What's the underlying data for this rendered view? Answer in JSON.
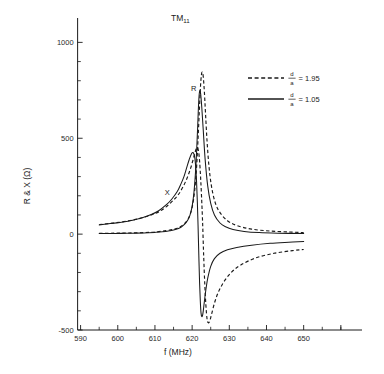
{
  "chart_data": {
    "type": "line",
    "title": "TM11",
    "title_base": "TM",
    "title_sub": "11",
    "xlabel": "f (MHz)",
    "ylabel": "R & X (Ω)",
    "ylabel_base": "R & X (",
    "ylabel_unit": "Ω",
    "ylabel_close": ")",
    "xlim": [
      585,
      663
    ],
    "ylim": [
      -500,
      1075
    ],
    "xticks": [
      590,
      600,
      610,
      620,
      630,
      640,
      650
    ],
    "xtick_labels": [
      "590",
      "600",
      "610",
      "620",
      "630",
      "640",
      "650"
    ],
    "xtick_minor_step": 5,
    "yticks": [
      -500,
      0,
      500,
      1000
    ],
    "ytick_labels": [
      "-500",
      "0",
      "500",
      "1000"
    ],
    "ytick_minor_step": 100,
    "grid": false,
    "legend_position": "upper right",
    "annotations": [
      {
        "text": "R",
        "x": 620.4,
        "y": 745,
        "name": "resistance-curve-label"
      },
      {
        "text": "X",
        "x": 613.3,
        "y": 205,
        "name": "reactance-curve-label"
      }
    ],
    "legend": [
      {
        "label": "d/a = 1.95",
        "numerator": "d",
        "denominator": "a",
        "equals": "= 1.95",
        "value": 1.95,
        "style": "dashed"
      },
      {
        "label": "d/a = 1.05",
        "numerator": "d",
        "denominator": "a",
        "equals": "= 1.05",
        "value": 1.05,
        "style": "solid"
      }
    ],
    "series": [
      {
        "name": "R (d/a = 1.05)",
        "quantity": "R",
        "ratio": 1.05,
        "style": "solid",
        "x": [
          595,
          598,
          601,
          604,
          607,
          610,
          612,
          614,
          615.5,
          617,
          618,
          618.8,
          619.4,
          620,
          620.5,
          620.9,
          621.2,
          621.45,
          621.65,
          621.85,
          622.05,
          622.3,
          622.6,
          623,
          623.5,
          624.2,
          625,
          626,
          627.5,
          629,
          631,
          634,
          638,
          643,
          650
        ],
        "y": [
          3,
          3,
          4,
          5,
          6,
          9,
          12,
          18,
          24,
          36,
          52,
          72,
          98,
          145,
          220,
          320,
          430,
          540,
          640,
          716,
          748,
          730,
          660,
          540,
          390,
          250,
          160,
          100,
          58,
          38,
          24,
          14,
          8,
          5,
          3
        ]
      },
      {
        "name": "X (d/a = 1.05)",
        "quantity": "X",
        "ratio": 1.05,
        "style": "solid",
        "x": [
          595,
          598,
          601,
          604,
          607,
          609,
          611,
          613,
          614.5,
          616,
          617,
          617.8,
          618.5,
          619.2,
          619.8,
          620.3,
          620.7,
          621,
          621.2,
          621.4,
          621.6,
          621.8,
          622,
          622.2,
          622.4,
          622.6,
          622.8,
          623,
          623.3,
          623.7,
          624.2,
          625,
          626,
          627.5,
          629.5,
          632,
          636,
          641,
          646,
          650
        ],
        "y": [
          48,
          55,
          62,
          72,
          88,
          102,
          122,
          152,
          182,
          222,
          262,
          300,
          344,
          388,
          418,
          425,
          400,
          340,
          270,
          170,
          40,
          -110,
          -250,
          -350,
          -412,
          -430,
          -424,
          -400,
          -350,
          -290,
          -230,
          -168,
          -128,
          -100,
          -82,
          -70,
          -58,
          -48,
          -42,
          -38
        ]
      },
      {
        "name": "R (d/a = 1.95)",
        "quantity": "R",
        "ratio": 1.95,
        "style": "dashed",
        "x": [
          595,
          599,
          603,
          607,
          610,
          613,
          615.5,
          617.5,
          619,
          620,
          620.7,
          621.2,
          621.6,
          621.95,
          622.25,
          622.5,
          622.75,
          623,
          623.3,
          623.6,
          624,
          624.5,
          625.2,
          626.2,
          627.5,
          629.5,
          632,
          636,
          641,
          646,
          650
        ],
        "y": [
          4,
          5,
          6,
          8,
          11,
          18,
          28,
          48,
          82,
          140,
          230,
          350,
          500,
          650,
          770,
          830,
          845,
          820,
          740,
          630,
          490,
          360,
          250,
          165,
          112,
          70,
          45,
          26,
          16,
          11,
          8
        ]
      },
      {
        "name": "X (d/a = 1.95)",
        "quantity": "X",
        "ratio": 1.95,
        "style": "dashed",
        "x": [
          595,
          599,
          603,
          606,
          609,
          611,
          613,
          615,
          616.5,
          617.8,
          618.8,
          619.6,
          620.2,
          620.7,
          621.1,
          621.4,
          621.65,
          621.9,
          622.15,
          622.45,
          622.8,
          623.1,
          623.4,
          623.7,
          624,
          624.3,
          624.7,
          625.2,
          626,
          627,
          628.5,
          630.5,
          633,
          637,
          642,
          647,
          650
        ],
        "y": [
          50,
          58,
          70,
          82,
          100,
          116,
          142,
          178,
          212,
          256,
          300,
          344,
          384,
          420,
          445,
          452,
          440,
          405,
          340,
          230,
          70,
          -110,
          -260,
          -370,
          -440,
          -462,
          -455,
          -420,
          -360,
          -305,
          -250,
          -200,
          -162,
          -125,
          -100,
          -86,
          -80
        ]
      }
    ]
  }
}
